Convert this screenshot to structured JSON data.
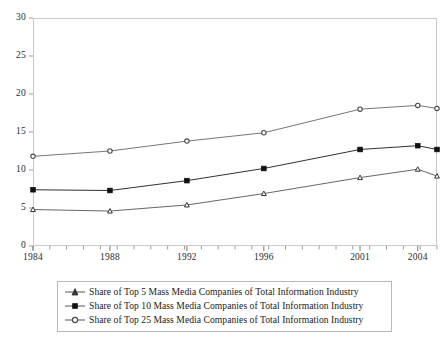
{
  "chart_data": {
    "type": "line",
    "title": "",
    "xlabel": "",
    "ylabel": "",
    "xlim": [
      1984,
      2005
    ],
    "ylim": [
      0,
      30
    ],
    "grid": false,
    "legend_position": "bottom",
    "xtick_labels": [
      "1984",
      "1988",
      "1992",
      "1996",
      "2001",
      "2004"
    ],
    "xtick_values": [
      1984,
      1988,
      1992,
      1996,
      2001,
      2004
    ],
    "ytick_labels": [
      "0",
      "5",
      "10",
      "15",
      "20",
      "25",
      "30"
    ],
    "ytick_values": [
      0,
      5,
      10,
      15,
      20,
      25,
      30
    ],
    "x": [
      1984,
      1988,
      1992,
      1996,
      2001,
      2004,
      2005
    ],
    "series": [
      {
        "name": "Share of  Top 5 Mass Media Companies of Total Information Industry",
        "marker": "triangle",
        "color": "#555555",
        "values": [
          4.8,
          4.6,
          5.4,
          6.9,
          9.0,
          10.1,
          9.2
        ]
      },
      {
        "name": "Share of Top 10 Mass Media Companies of Total Information Industry",
        "marker": "filled-square",
        "color": "#1a1a1a",
        "values": [
          7.4,
          7.3,
          8.6,
          10.2,
          12.7,
          13.2,
          12.7
        ]
      },
      {
        "name": "Share of Top 25 Mass Media Companies of Total Information Industry",
        "marker": "open-circle",
        "color": "#666666",
        "values": [
          11.8,
          12.5,
          13.8,
          14.9,
          18.0,
          18.5,
          18.1
        ]
      }
    ]
  },
  "legend": {
    "items": [
      {
        "label": "Share of  Top 5 Mass Media Companies of Total Information Industry"
      },
      {
        "label": "Share of Top 10 Mass Media Companies of Total Information Industry"
      },
      {
        "label": "Share of Top 25 Mass Media Companies of Total Information Industry"
      }
    ]
  },
  "axes": {
    "y_labels": [
      "30",
      "25",
      "20",
      "15",
      "10",
      "5",
      "0"
    ],
    "x_labels": [
      "1984",
      "1988",
      "1992",
      "1996",
      "2001",
      "2004"
    ]
  }
}
